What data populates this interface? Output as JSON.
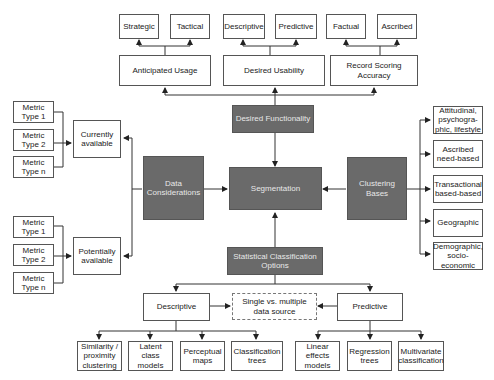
{
  "diagram": {
    "center": "Segmentation",
    "top": {
      "label": "Desired Functionality",
      "groups": [
        {
          "label": "Anticipated Usage",
          "children": [
            "Strategic",
            "Tactical"
          ]
        },
        {
          "label": "Desired Usability",
          "children": [
            "Descriptive",
            "Predictive"
          ]
        },
        {
          "label": "Record Scoring Accuracy",
          "children": [
            "Factual",
            "Ascribed"
          ]
        }
      ]
    },
    "left": {
      "label": "Data Considerations",
      "groups": [
        {
          "label": "Currently available",
          "children": [
            "Metric Type 1",
            "Metric Type 2",
            "Metric Type n"
          ]
        },
        {
          "label": "Potentially available",
          "children": [
            "Metric Type 1",
            "Metric Type 2",
            "Metric Type n"
          ]
        }
      ]
    },
    "right": {
      "label": "Clustering Bases",
      "children": [
        "Attitudinal, psychogra-phic, lifestyle",
        "Ascribed need-based",
        "Transactional based-based",
        "Geographic",
        "Demographic, socio-economic"
      ]
    },
    "bottom": {
      "label": "Statistical Classification Options",
      "shared": "Single vs. multiple data source",
      "groups": [
        {
          "label": "Descriptive",
          "children": [
            "Similarity / proximity clustering",
            "Latent class models",
            "Perceptual maps",
            "Classification trees"
          ]
        },
        {
          "label": "Predictive",
          "children": [
            "Linear effects models",
            "Regression trees",
            "Multivariate classification"
          ]
        }
      ]
    }
  }
}
